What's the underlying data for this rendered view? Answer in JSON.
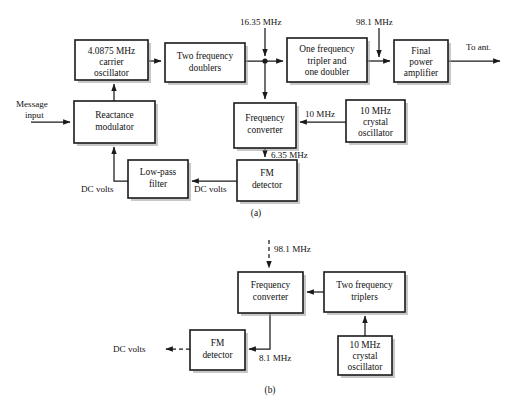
{
  "figure": {
    "type": "block-diagram",
    "title_a": "(a)",
    "title_b": "(b)",
    "panels": [
      {
        "id": "a",
        "caption": "(a)",
        "blocks": [
          {
            "id": "carrier_osc",
            "lines": [
              "4.0875 MHz",
              "carrier",
              "oscillator"
            ]
          },
          {
            "id": "two_doublers",
            "lines": [
              "Two frequency",
              "doublers"
            ]
          },
          {
            "id": "tripler_doubler",
            "lines": [
              "One frequency",
              "tripler and",
              "one doubler"
            ]
          },
          {
            "id": "final_pa",
            "lines": [
              "Final",
              "power",
              "amplifier"
            ]
          },
          {
            "id": "reactance_mod",
            "lines": [
              "Reactance",
              "modulator"
            ]
          },
          {
            "id": "freq_conv",
            "lines": [
              "Frequency",
              "converter"
            ]
          },
          {
            "id": "xtal_osc",
            "lines": [
              "10 MHz",
              "crystal",
              "oscillator"
            ]
          },
          {
            "id": "lpf",
            "lines": [
              "Low-pass",
              "filter"
            ]
          },
          {
            "id": "fm_det",
            "lines": [
              "FM",
              "detector"
            ]
          }
        ],
        "signals": [
          {
            "id": "sig_1635",
            "text": "16.35 MHz"
          },
          {
            "id": "sig_981",
            "text": "98.1 MHz"
          },
          {
            "id": "sig_to_ant",
            "text": "To ant."
          },
          {
            "id": "sig_message_1",
            "text": "Message"
          },
          {
            "id": "sig_message_2",
            "text": "input"
          },
          {
            "id": "sig_10mhz",
            "text": "10 MHz"
          },
          {
            "id": "sig_635",
            "text": "6.35 MHz"
          },
          {
            "id": "sig_dc_right",
            "text": "DC volts"
          },
          {
            "id": "sig_dc_left",
            "text": "DC volts"
          }
        ]
      },
      {
        "id": "b",
        "caption": "(b)",
        "blocks": [
          {
            "id": "freq_conv_b",
            "lines": [
              "Frequency",
              "converter"
            ]
          },
          {
            "id": "two_triplers_b",
            "lines": [
              "Two frequency",
              "triplers"
            ]
          },
          {
            "id": "xtal_osc_b",
            "lines": [
              "10 MHz",
              "crystal",
              "oscillator"
            ]
          },
          {
            "id": "fm_det_b",
            "lines": [
              "FM",
              "detector"
            ]
          }
        ],
        "signals": [
          {
            "id": "sig_981_b",
            "text": "98.1 MHz"
          },
          {
            "id": "sig_81_b",
            "text": "8.1 MHz"
          },
          {
            "id": "sig_dc_b",
            "text": "DC volts"
          }
        ]
      }
    ],
    "colors": {
      "ink": "#1a1a1a",
      "paper": "#ffffff",
      "shadow": "#9a9a9a"
    }
  }
}
